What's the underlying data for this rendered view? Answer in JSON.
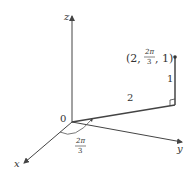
{
  "diagram": {
    "type": "cylindrical-coordinates-3d",
    "axes": {
      "x": "x",
      "y": "y",
      "z": "z"
    },
    "origin_label": "0",
    "point_label": {
      "open": "(2,",
      "frac_num": "2π",
      "frac_den": "3",
      "close": ", 1)"
    },
    "radius_label": "2",
    "height_label": "1",
    "angle_label": {
      "num": "2π",
      "den": "3"
    },
    "colors": {
      "line": "#444444",
      "text": "#333333"
    }
  }
}
